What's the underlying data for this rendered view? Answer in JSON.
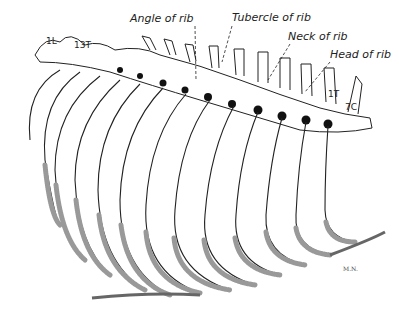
{
  "figure": {
    "labels": [
      {
        "id": "angle",
        "text": "Angle of rib",
        "x": 188,
        "y": 22
      },
      {
        "id": "tubercle",
        "text": "Tubercle of rib",
        "x": 232,
        "y": 21
      },
      {
        "id": "neck",
        "text": "Neck of rib",
        "x": 288,
        "y": 40
      },
      {
        "id": "head",
        "text": "Head of rib",
        "x": 330,
        "y": 58
      }
    ],
    "vertebra_labels": [
      {
        "id": "1L",
        "text": "1L",
        "x": 46,
        "y": 44
      },
      {
        "id": "13T",
        "text": "13T",
        "x": 77,
        "y": 48
      },
      {
        "id": "1T",
        "text": "1T",
        "x": 328,
        "y": 97
      },
      {
        "id": "7C",
        "text": "7C",
        "x": 344,
        "y": 110
      }
    ],
    "signature": {
      "text": "M.N.",
      "x": 343,
      "y": 271
    },
    "colors": {
      "ink": "#222222",
      "cartilage": "#999999",
      "background": "#ffffff"
    }
  }
}
